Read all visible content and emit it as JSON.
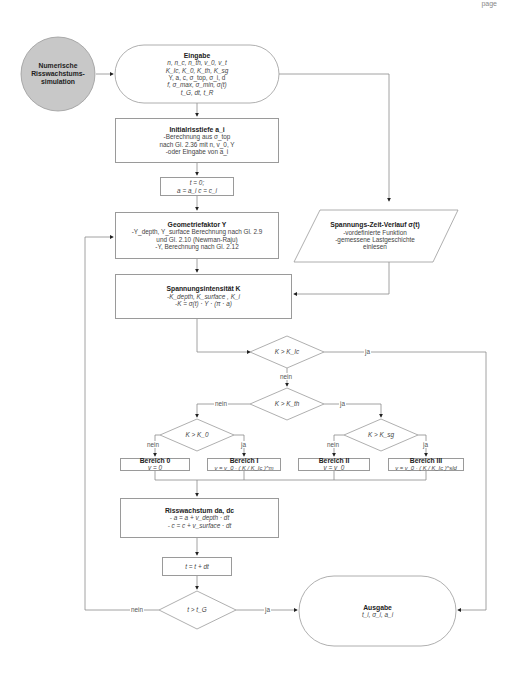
{
  "header": {
    "page_fragment": "page"
  },
  "start": {
    "line1": "Numerische",
    "line2": "Risswachstums-",
    "line3": "simulation"
  },
  "input": {
    "title": "Eingabe",
    "lines": [
      "n, n_c, n_th, v_0, v_t",
      "K_Ic, K_0, K_th, K_sg",
      "Y, a, c, σ_top, σ_i, d",
      "f, σ_max, σ_min, σ(t)",
      "t_G, dt, t_R"
    ]
  },
  "initial_depth": {
    "title": "Initialrisstiefe a_i",
    "lines": [
      "-Berechnung aus σ_top",
      "nach Gl. 2.36 mit n, v_0, Y",
      "-oder Eingabe von a_i"
    ]
  },
  "init": {
    "line1": "t = 0;",
    "line2": "a = a_i c = c_i"
  },
  "geometry": {
    "title": "Geometriefaktor Y",
    "lines": [
      "-Y_depth, Y_surface Berechnung nach Gl. 2.9",
      "und Gl. 2.10 (Newman-Raju)",
      "-Y, Berechnung nach Gl. 2.12"
    ]
  },
  "stress_history": {
    "title": "Spannungs-Zeit-Verlauf σ(t)",
    "lines": [
      "-vordefinierte Funktion",
      "-gemessene Lastgeschichte",
      "einlesen"
    ]
  },
  "stress_intensity": {
    "title": "Spannungsintensität K",
    "lines": [
      "-K_depth, K_surface , K_i",
      "-K = σ(t) · Y · (π · a)"
    ]
  },
  "decisions": {
    "k_ic": "K > K_Ic",
    "k_th": "K > K_th",
    "k_0": "K > K_0",
    "k_sg": "K > K_sg",
    "t_g": "t > t_G"
  },
  "edge_labels": {
    "yes": "ja",
    "no": "nein"
  },
  "regions": [
    {
      "title": "Bereich 0",
      "formula": "v = 0"
    },
    {
      "title": "Bereich I",
      "formula": "v = v_0 · ( K / K_Ic )^m"
    },
    {
      "title": "Bereich II",
      "formula": "v = v_0"
    },
    {
      "title": "Bereich III",
      "formula": "v = v_0 · ( K / K_Ic )^sld"
    }
  ],
  "crack_growth": {
    "title": "Risswachstum da, dc",
    "lines": [
      "- a = a + v_depth · dt",
      "- c = c + v_surface · dt"
    ]
  },
  "time_step": {
    "text": "t = t + dt"
  },
  "output": {
    "title": "Ausgabe",
    "line": "t_i, σ_i, a_i"
  },
  "colors": {
    "line": "#8c8c8c",
    "start_fill": "#c8c8c8",
    "box_border": "#9a9a9a"
  }
}
